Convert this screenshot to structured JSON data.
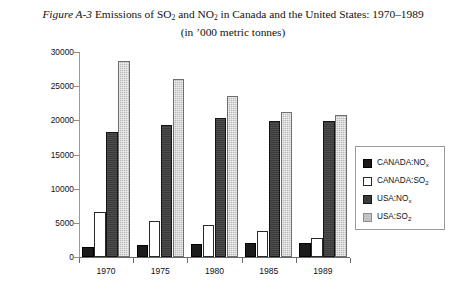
{
  "title": {
    "figure_label": "Figure A-3",
    "line1_a": " Emissions of SO",
    "line1_sub1": "2",
    "line1_b": " and NO",
    "line1_sub2": "2",
    "line1_c": " in Canada and the United States: 1970–1989",
    "line2": "(in ’000 metric tonnes)"
  },
  "legend": {
    "items": [
      {
        "label_main": "CANADA:NO",
        "label_sub": "x",
        "color": "#1b1b1b",
        "swatch": "canada-nox-swatch"
      },
      {
        "label_main": "CANADA:SO",
        "label_sub": "2",
        "color": "#ffffff",
        "swatch": "canada-so2-swatch"
      },
      {
        "label_main": "USA:NO",
        "label_sub": "x",
        "color": "#3a3a3a",
        "swatch": "usa-nox-swatch"
      },
      {
        "label_main": "USA:SO",
        "label_sub": "2",
        "color": "#c2c2c2",
        "swatch": "usa-so2-swatch"
      }
    ]
  },
  "footnote_fragment": "",
  "chart_data": {
    "type": "bar",
    "xlabel": "",
    "ylabel": "",
    "ylim": [
      0,
      30000
    ],
    "yticks": [
      0,
      5000,
      10000,
      15000,
      20000,
      25000,
      30000
    ],
    "ytick_labels": [
      "0",
      "5000",
      "10000",
      "15000",
      "20000",
      "25000",
      "30000"
    ],
    "grid": false,
    "legend_position": "right",
    "categories": [
      "1970",
      "1975",
      "1980",
      "1985",
      "1989"
    ],
    "series": [
      {
        "name": "CANADA:NOx",
        "color": "#1b1b1b",
        "values": [
          1500,
          1700,
          1900,
          2000,
          2000
        ]
      },
      {
        "name": "CANADA:SO2",
        "color": "#ffffff",
        "values": [
          6600,
          5200,
          4700,
          3800,
          2800
        ]
      },
      {
        "name": "USA:NOx",
        "color": "#3a3a3a",
        "values": [
          18300,
          19300,
          20400,
          19900,
          19900
        ]
      },
      {
        "name": "USA:SO2",
        "color": "#c2c2c2",
        "values": [
          28700,
          26000,
          23500,
          21200,
          20800
        ]
      }
    ]
  }
}
